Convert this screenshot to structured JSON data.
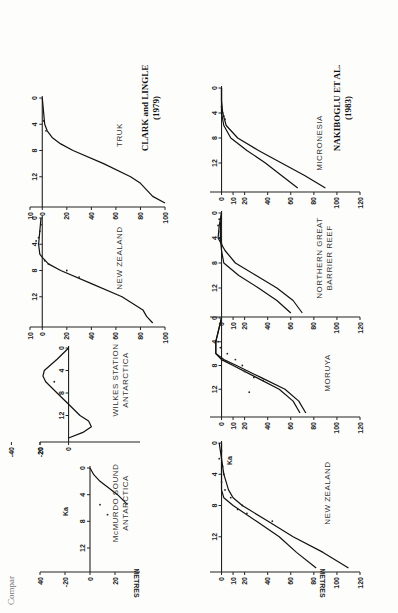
{
  "caption": "Compar",
  "sources": [
    {
      "title": "CLARK and LINGLE",
      "year": "(1979)"
    },
    {
      "title": "NAKIBOGLU ET AL.",
      "year": "(1983)"
    }
  ],
  "axis": {
    "y_label": "METRES",
    "x_label": "Ka"
  },
  "chart_data": [
    {
      "type": "line",
      "group": "CLARK and LINGLE (1979)",
      "title": "McMURDO SOUND ANTARCTICA",
      "xlabel": "Ka",
      "ylabel": "METRES",
      "x_ticks": [
        0,
        4,
        8,
        12
      ],
      "y_ticks": [
        40,
        20,
        0,
        -20
      ],
      "xlim": [
        0,
        15
      ],
      "ylim": [
        40,
        -30
      ],
      "series": [
        {
          "name": "model",
          "x": [
            0,
            1,
            2,
            3,
            4,
            5.5
          ],
          "y": [
            0,
            3,
            8,
            15,
            22,
            30
          ]
        }
      ],
      "points": [
        {
          "x": 5.5,
          "y": 8
        },
        {
          "x": 7,
          "y": 14
        }
      ]
    },
    {
      "type": "line",
      "group": "CLARK and LINGLE (1979)",
      "title": "WILKES STATION ANTARCTICA",
      "xlabel": "Ka",
      "ylabel": "METRES",
      "x_ticks": [
        0,
        4,
        8,
        12
      ],
      "y_ticks": [
        20,
        0,
        -20,
        -40
      ],
      "xlim": [
        0,
        16
      ],
      "ylim": [
        20,
        -50
      ],
      "series": [
        {
          "name": "model",
          "x": [
            0,
            2,
            4,
            5,
            6,
            8,
            10,
            12,
            13,
            14,
            15,
            16
          ],
          "y": [
            0,
            -8,
            -17,
            -18,
            -16,
            -8,
            0,
            8,
            14,
            16,
            10,
            0
          ]
        }
      ],
      "points": [
        {
          "x": 6,
          "y": -10
        }
      ]
    },
    {
      "type": "line",
      "group": "CLARK and LINGLE (1979)",
      "title": "NEW ZEALAND",
      "xlabel": "Ka",
      "ylabel": "METRES",
      "x_ticks": [
        0,
        4,
        8,
        12
      ],
      "y_ticks": [
        10,
        0,
        20,
        40,
        60,
        80,
        100
      ],
      "xlim": [
        0,
        16
      ],
      "ylim": [
        10,
        100
      ],
      "series": [
        {
          "name": "model",
          "x": [
            0,
            2,
            4,
            5.5,
            6,
            7,
            8,
            10,
            12,
            14,
            15,
            16
          ],
          "y": [
            -1,
            -2,
            -3,
            -2,
            0,
            5,
            15,
            40,
            65,
            82,
            85,
            90
          ]
        }
      ],
      "points": [
        {
          "x": 1,
          "y": -1
        },
        {
          "x": 2,
          "y": -2
        },
        {
          "x": 3,
          "y": -3
        },
        {
          "x": 3.5,
          "y": -5
        },
        {
          "x": 6.5,
          "y": 2
        },
        {
          "x": 7,
          "y": 5
        },
        {
          "x": 8,
          "y": 20
        },
        {
          "x": 9,
          "y": 30
        }
      ]
    },
    {
      "type": "line",
      "group": "CLARK and LINGLE (1979)",
      "title": "TRUK",
      "xlabel": "Ka",
      "ylabel": "METRES",
      "x_ticks": [
        0,
        4,
        8,
        12
      ],
      "y_ticks": [
        10,
        0,
        20,
        40,
        60,
        80,
        100
      ],
      "xlim": [
        0,
        16
      ],
      "ylim": [
        10,
        100
      ],
      "series": [
        {
          "name": "model",
          "x": [
            0,
            2,
            4,
            5,
            6,
            7,
            8,
            10,
            12,
            13,
            14,
            15,
            16
          ],
          "y": [
            0,
            1,
            2,
            4,
            8,
            15,
            25,
            50,
            72,
            80,
            85,
            90,
            100
          ]
        }
      ],
      "points": [
        {
          "x": 3.5,
          "y": 1
        },
        {
          "x": 5,
          "y": 3
        }
      ]
    },
    {
      "type": "line",
      "group": "NAKIBOGLU ET AL. (1983)",
      "title": "NEW ZEALAND",
      "xlabel": "Ka",
      "ylabel": "METRES",
      "x_ticks": [
        0,
        4,
        8,
        12
      ],
      "y_ticks": [
        10,
        0,
        20,
        40,
        60,
        80,
        100,
        120
      ],
      "xlim": [
        0,
        16
      ],
      "ylim": [
        10,
        120
      ],
      "series": [
        {
          "name": "upper",
          "x": [
            0,
            2,
            4,
            6,
            7,
            8,
            10,
            12,
            14,
            16
          ],
          "y": [
            0,
            0,
            0,
            0,
            2,
            10,
            30,
            50,
            65,
            82
          ]
        },
        {
          "name": "lower",
          "x": [
            0,
            2,
            4,
            5,
            6,
            7,
            8,
            10,
            12,
            14,
            16
          ],
          "y": [
            -2,
            0,
            2,
            4,
            6,
            10,
            18,
            40,
            62,
            88,
            110
          ]
        }
      ],
      "points": [
        {
          "x": 1,
          "y": 0
        },
        {
          "x": 2,
          "y": -2
        },
        {
          "x": 3,
          "y": 1
        },
        {
          "x": 4,
          "y": 2
        },
        {
          "x": 5,
          "y": 0
        },
        {
          "x": 6,
          "y": 3
        },
        {
          "x": 7,
          "y": 8
        },
        {
          "x": 8,
          "y": 18
        },
        {
          "x": 9,
          "y": 22
        },
        {
          "x": 10,
          "y": 44
        },
        {
          "x": 8.5,
          "y": 14
        }
      ]
    },
    {
      "type": "line",
      "group": "NAKIBOGLU ET AL. (1983)",
      "title": "MORUYA",
      "xlabel": "Ka",
      "ylabel": "METRES",
      "x_ticks": [
        0,
        4,
        8,
        12
      ],
      "y_ticks": [
        10,
        0,
        20,
        40,
        60,
        80,
        100,
        120
      ],
      "xlim": [
        0,
        16
      ],
      "ylim": [
        10,
        120
      ],
      "series": [
        {
          "name": "upper",
          "x": [
            0,
            4,
            6,
            7,
            8,
            10,
            12,
            14,
            16
          ],
          "y": [
            0,
            -5,
            -5,
            0,
            10,
            30,
            50,
            62,
            68
          ]
        },
        {
          "name": "lower",
          "x": [
            0,
            4,
            6,
            7,
            8,
            10,
            12,
            14,
            16
          ],
          "y": [
            0,
            -5,
            -5,
            2,
            13,
            34,
            55,
            67,
            73
          ]
        }
      ],
      "points": [
        {
          "x": 4,
          "y": -3
        },
        {
          "x": 5,
          "y": -1
        },
        {
          "x": 6,
          "y": 5
        },
        {
          "x": 7,
          "y": 12
        },
        {
          "x": 8,
          "y": 18
        },
        {
          "x": 9,
          "y": 20
        },
        {
          "x": 10,
          "y": 28
        },
        {
          "x": 10.5,
          "y": 36
        },
        {
          "x": 12.5,
          "y": 24
        }
      ]
    },
    {
      "type": "line",
      "group": "NAKIBOGLU ET AL. (1983)",
      "title": "NORTHERN GREAT BARRIER REEF",
      "xlabel": "Ka",
      "ylabel": "METRES",
      "x_ticks": [
        0,
        4,
        8,
        12
      ],
      "y_ticks": [
        10,
        0,
        20,
        40,
        60,
        80,
        100,
        120
      ],
      "xlim": [
        0,
        16
      ],
      "ylim": [
        10,
        120
      ],
      "series": [
        {
          "name": "upper",
          "x": [
            0,
            2,
            4,
            6,
            8,
            10,
            12,
            14,
            16
          ],
          "y": [
            0,
            -1,
            -1,
            0,
            2,
            15,
            32,
            48,
            60
          ]
        },
        {
          "name": "lower",
          "x": [
            0,
            2,
            4,
            5,
            6,
            8,
            10,
            12,
            14,
            16
          ],
          "y": [
            0,
            -2,
            -3,
            0,
            3,
            12,
            30,
            48,
            62,
            70
          ]
        }
      ],
      "points": [
        {
          "x": 1,
          "y": -2
        },
        {
          "x": 2,
          "y": -3
        },
        {
          "x": 3,
          "y": -1
        },
        {
          "x": 4,
          "y": -2
        },
        {
          "x": 5,
          "y": 0
        }
      ]
    },
    {
      "type": "line",
      "group": "NAKIBOGLU ET AL. (1983)",
      "title": "MICRONESIA",
      "xlabel": "Ka",
      "ylabel": "METRES",
      "x_ticks": [
        0,
        4,
        8,
        12
      ],
      "y_ticks": [
        10,
        0,
        20,
        40,
        60,
        80,
        100,
        120
      ],
      "xlim": [
        0,
        16
      ],
      "ylim": [
        10,
        120
      ],
      "series": [
        {
          "name": "upper",
          "x": [
            0,
            2,
            4,
            6,
            8,
            10,
            12,
            14,
            16
          ],
          "y": [
            0,
            0,
            0,
            2,
            8,
            22,
            38,
            52,
            66
          ]
        },
        {
          "name": "lower",
          "x": [
            0,
            2,
            4,
            6,
            8,
            10,
            12,
            14,
            16
          ],
          "y": [
            0,
            0,
            1,
            4,
            14,
            32,
            52,
            72,
            90
          ]
        }
      ],
      "points": [
        {
          "x": 3,
          "y": 0
        },
        {
          "x": 4,
          "y": 1
        },
        {
          "x": 4.5,
          "y": 2
        },
        {
          "x": 5,
          "y": 3
        }
      ]
    }
  ],
  "panels": {
    "c1": "McMURDO SOUND",
    "c1b": "ANTARCTICA",
    "c2": "WILKES STATION",
    "c2b": "ANTARCTICA",
    "c3": "NEW ZEALAND",
    "c4": "TRUK",
    "n1": "NEW ZEALAND",
    "n2": "MORUYA",
    "n3": "NORTHERN GREAT",
    "n3b": "BARRIER REEF",
    "n4": "MICRONESIA"
  }
}
